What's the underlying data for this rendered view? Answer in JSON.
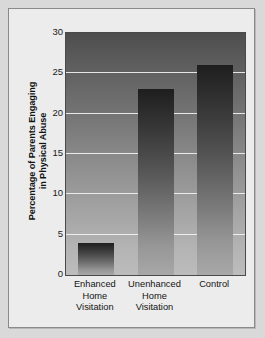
{
  "chart_data": {
    "type": "bar",
    "title": "",
    "xlabel": "",
    "ylabel": "Percentage of Parents Engaging in Physical Abuse",
    "ylabel_lines": [
      "Percentage of Parents Engaging",
      "in Physical Abuse"
    ],
    "categories": [
      "Enhanced Home Visitation",
      "Unenhanced Home Visitation",
      "Control"
    ],
    "category_lines": [
      [
        "Enhanced",
        "Home",
        "Visitation"
      ],
      [
        "Unenhanced",
        "Home",
        "Visitation"
      ],
      [
        "Control"
      ]
    ],
    "values": [
      4,
      23,
      26
    ],
    "ylim": [
      0,
      30
    ],
    "yticks": [
      0,
      5,
      10,
      15,
      20,
      25,
      30
    ],
    "ytick_labels": [
      "0",
      "5",
      "10",
      "15",
      "20",
      "25",
      "30"
    ],
    "grid": true,
    "legend": "none",
    "colors": {
      "bar_top": "#1e1e1e",
      "bar_bottom": "#a8a8a8",
      "plot_top": "#4e4e4e",
      "plot_bottom": "#bcbcbc",
      "gridline": "#f2f2f2",
      "panel_background": "#ececec",
      "page_background": "#d9d9d9",
      "axis_border": "#4a4a4a",
      "text": "#131313"
    }
  }
}
